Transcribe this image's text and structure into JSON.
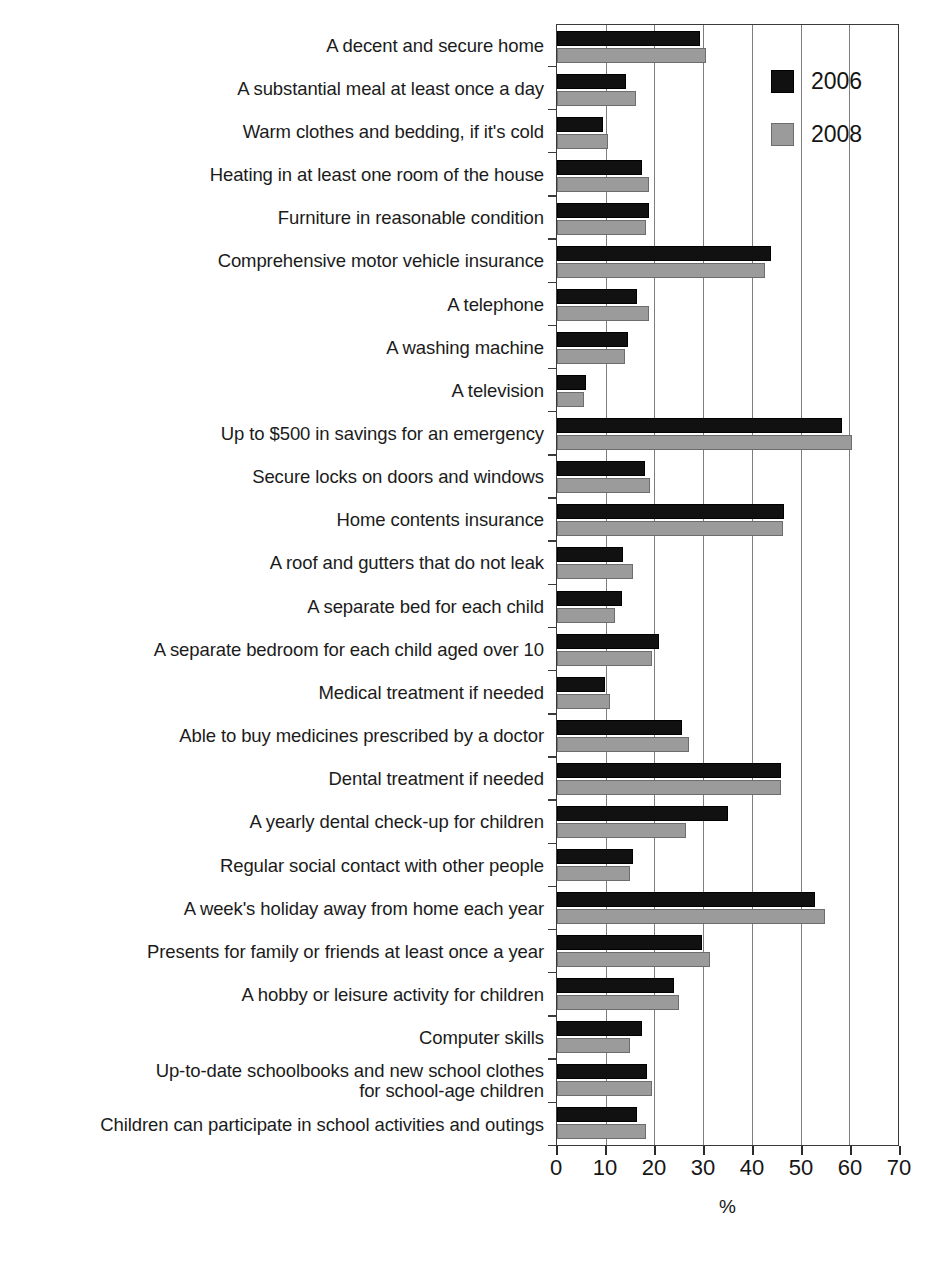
{
  "chart_data": {
    "type": "bar",
    "orientation": "horizontal",
    "title": "",
    "xlabel": "%",
    "ylabel": "",
    "xlim": [
      0,
      70
    ],
    "xticks": [
      0,
      10,
      20,
      30,
      40,
      50,
      60,
      70
    ],
    "xtick_labels": [
      "0",
      "10",
      "20",
      "30",
      "40",
      "50",
      "60",
      "70"
    ],
    "grid": "vertical",
    "legend_position": "top-right",
    "categories": [
      "A decent and secure home",
      "A substantial meal at least once a day",
      "Warm clothes and bedding, if it's cold",
      "Heating in at least one room of the house",
      "Furniture in reasonable condition",
      "Comprehensive motor vehicle insurance",
      "A telephone",
      "A washing machine",
      "A television",
      "Up to $500 in savings for an emergency",
      "Secure locks on doors and windows",
      "Home contents insurance",
      "A roof and gutters that do not leak",
      "A separate bed for each child",
      "A separate bedroom for each child aged over 10",
      "Medical treatment if needed",
      "Able to buy medicines prescribed by a doctor",
      "Dental treatment if needed",
      "A yearly dental check-up for children",
      "Regular social contact with other people",
      "A week's holiday away from home each year",
      "Presents for family or friends at least once a year",
      "A hobby or leisure activity for children",
      "Computer skills",
      "Up-to-date schoolbooks and new school clothes\nfor school-age children",
      "Children can participate in school activities and outings"
    ],
    "series": [
      {
        "name": "2006",
        "color": "#111111",
        "values": [
          29.4,
          14.2,
          9.4,
          17.4,
          18.8,
          44.0,
          16.4,
          14.5,
          6.0,
          58.5,
          18.0,
          46.5,
          13.5,
          13.4,
          21.0,
          9.8,
          25.7,
          46.0,
          35.0,
          15.5,
          53.0,
          29.8,
          24.0,
          17.5,
          18.5,
          16.5
        ]
      },
      {
        "name": "2008",
        "color": "#9b9b9b",
        "values": [
          30.6,
          16.2,
          10.5,
          18.8,
          18.2,
          42.8,
          18.8,
          13.9,
          5.5,
          60.5,
          19.0,
          46.3,
          15.5,
          12.0,
          19.5,
          10.8,
          27.0,
          46.0,
          26.5,
          15.0,
          55.0,
          31.5,
          25.0,
          15.0,
          19.5,
          18.3
        ]
      }
    ]
  },
  "legend": {
    "items": [
      {
        "label": "2006",
        "swatch": "black-square-icon"
      },
      {
        "label": "2008",
        "swatch": "gray-square-icon"
      }
    ]
  },
  "axis": {
    "x_title": "%"
  }
}
